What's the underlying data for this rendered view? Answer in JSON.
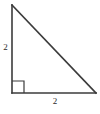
{
  "figure": {
    "type": "right-triangle-diagram",
    "background_color": "#ffffff",
    "stroke_color": "#3b3b3b",
    "text_color": "#2b2b2b",
    "vertices": {
      "apex": [
        12,
        5
      ],
      "right_angle": [
        12,
        93
      ],
      "base_end": [
        96,
        93
      ]
    },
    "right_angle_marker": {
      "size": 12,
      "corner": [
        12,
        93
      ]
    },
    "labels": {
      "vertical_leg": "2",
      "horizontal_leg": "2"
    }
  }
}
